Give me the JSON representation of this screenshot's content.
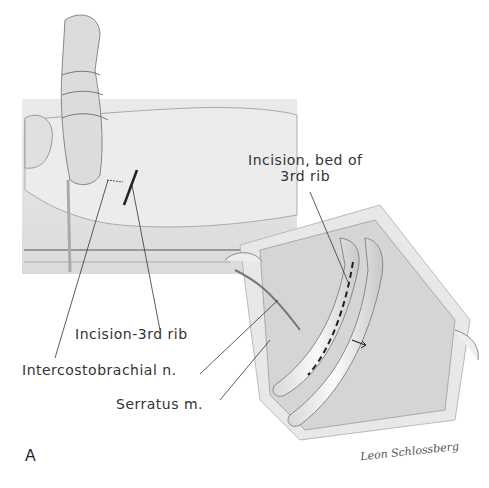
{
  "figure": {
    "panel_letter": "A",
    "signature": "Leon Schlossberg",
    "labels": {
      "incision_bed": [
        "Incision, bed of",
        "3rd rib"
      ],
      "incision_3rd_rib": "Incision-3rd rib",
      "intercostobrachial": "Intercostobrachial n.",
      "serratus": "Serratus m."
    },
    "views": [
      {
        "id": "patient-position",
        "description": "Patient lateral with arm suspended, incision line at 3rd rib"
      },
      {
        "id": "operative-field",
        "description": "Retracted wound exposing bed of 3rd rib with dashed incision line"
      }
    ],
    "colors": {
      "ink": "#333333",
      "shade": "#bdbdbd",
      "light": "#e6e6e6"
    }
  }
}
